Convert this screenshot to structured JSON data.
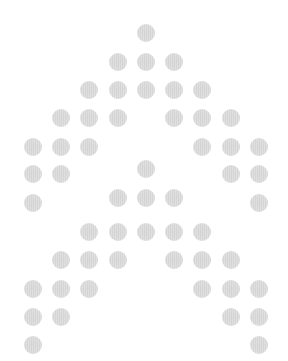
{
  "pattern": {
    "description": "Dot-matrix double chevron (two stacked up-arrow shapes)",
    "dot_color": "#d4d4d4",
    "background": "#ffffff",
    "dot_diameter": 18,
    "columns_x": [
      33,
      61,
      89,
      118,
      146,
      174,
      202,
      231,
      259
    ],
    "rows": [
      {
        "y": 33,
        "cols": [
          4
        ]
      },
      {
        "y": 62,
        "cols": [
          3,
          4,
          5
        ]
      },
      {
        "y": 90,
        "cols": [
          2,
          3,
          4,
          5,
          6
        ]
      },
      {
        "y": 118,
        "cols": [
          1,
          2,
          3,
          5,
          6,
          7
        ]
      },
      {
        "y": 147,
        "cols": [
          0,
          1,
          2,
          6,
          7,
          8
        ]
      },
      {
        "y": 174,
        "cols": [
          0,
          1,
          7,
          8
        ]
      },
      {
        "y": 169,
        "cols": [
          4
        ]
      },
      {
        "y": 203,
        "cols": [
          0,
          8
        ]
      },
      {
        "y": 198,
        "cols": [
          3,
          4,
          5
        ]
      },
      {
        "y": 232,
        "cols": [
          2,
          3,
          4,
          5,
          6
        ]
      },
      {
        "y": 260,
        "cols": [
          1,
          2,
          3,
          5,
          6,
          7
        ]
      },
      {
        "y": 289,
        "cols": [
          0,
          1,
          2,
          6,
          7,
          8
        ]
      },
      {
        "y": 317,
        "cols": [
          0,
          1,
          7,
          8
        ]
      },
      {
        "y": 345,
        "cols": [
          0,
          8
        ]
      }
    ]
  }
}
